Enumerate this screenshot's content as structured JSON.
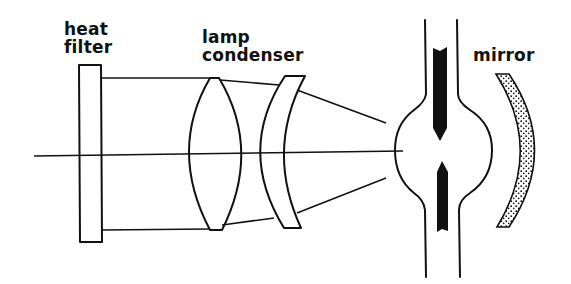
{
  "diagram": {
    "type": "optical-schematic",
    "labels": {
      "heat_filter_line1": "heat",
      "heat_filter_line2": "filter",
      "lamp_condenser_line1": "lamp",
      "lamp_condenser_line2": "condenser",
      "mirror": "mirror"
    },
    "components": [
      {
        "name": "heat filter",
        "shape": "rectangular plate"
      },
      {
        "name": "lamp condenser",
        "shape": "biconvex lens + meniscus lens"
      },
      {
        "name": "lamp",
        "shape": "bulb with two electrodes"
      },
      {
        "name": "mirror",
        "shape": "concave stippled reflector"
      }
    ],
    "colors": {
      "ink": "#111111",
      "background": "#ffffff"
    }
  }
}
